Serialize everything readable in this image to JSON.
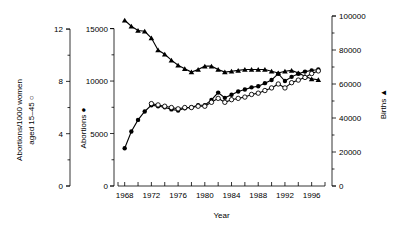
{
  "chart_data": {
    "type": "line",
    "title": "",
    "xlabel": "Year",
    "x": [
      1968,
      1969,
      1970,
      1971,
      1972,
      1973,
      1974,
      1975,
      1976,
      1977,
      1978,
      1979,
      1980,
      1981,
      1982,
      1983,
      1984,
      1985,
      1986,
      1987,
      1988,
      1989,
      1990,
      1991,
      1992,
      1993,
      1994,
      1995,
      1996,
      1997
    ],
    "xlim": [
      1967,
      1998
    ],
    "xticks_major": [
      1968,
      1972,
      1976,
      1980,
      1984,
      1988,
      1992,
      1996
    ],
    "xticks_minor": [
      1970,
      1974,
      1978,
      1982,
      1986,
      1990,
      1994
    ],
    "xtick_labels": [
      "1968",
      "1972",
      "1976",
      "1980",
      "1984",
      "1988",
      "1992",
      "1996"
    ],
    "grid": false,
    "legend_position": "axis-labels",
    "axes": [
      {
        "id": "rate-axis",
        "side": "left-outer",
        "label": "Abortions/1000 women aged 15–45 ○",
        "marker": "open-circle",
        "ticks": [
          0,
          4,
          8,
          12
        ],
        "tick_labels": [
          "0",
          "4",
          "8",
          "12"
        ],
        "minor_step": 2,
        "ylim": [
          0,
          13
        ]
      },
      {
        "id": "abortions-axis",
        "side": "left-inner",
        "label": "Abortions ●",
        "marker": "filled-circle",
        "ticks": [
          0,
          5000,
          10000,
          15000
        ],
        "tick_labels": [
          "0",
          "5000",
          "10000",
          "15000"
        ],
        "minor_step": 2500,
        "ylim": [
          0,
          16200
        ]
      },
      {
        "id": "births-axis",
        "side": "right",
        "label": "Births ▲",
        "marker": "filled-triangle",
        "ticks": [
          0,
          20000,
          40000,
          60000,
          80000,
          100000
        ],
        "tick_labels": [
          "0",
          "20000",
          "40000",
          "60000",
          "80000",
          "100000"
        ],
        "minor_step": 10000,
        "ylim": [
          0,
          100000
        ]
      }
    ],
    "series": [
      {
        "name": "Births",
        "axis": "births-axis",
        "marker": "filled-triangle",
        "values": [
          97500,
          94000,
          91500,
          91000,
          87000,
          80000,
          77500,
          74000,
          71000,
          69000,
          67000,
          68500,
          70500,
          70500,
          68500,
          67000,
          67500,
          68000,
          68500,
          68500,
          68500,
          68500,
          67500,
          66500,
          67500,
          68000,
          66500,
          64500,
          63000,
          62500
        ]
      },
      {
        "name": "Abortions",
        "axis": "abortions-axis",
        "marker": "filled-circle",
        "values": [
          3600,
          5200,
          6300,
          7100,
          7700,
          7600,
          7500,
          7300,
          7200,
          7400,
          7500,
          7700,
          7700,
          8200,
          8900,
          8400,
          8700,
          9000,
          9200,
          9400,
          9500,
          9800,
          10100,
          10700,
          10000,
          10400,
          10700,
          10900,
          11000,
          11100
        ]
      },
      {
        "name": "Abortions/1000 women aged 15-45",
        "axis": "rate-axis",
        "marker": "open-circle",
        "values": [
          null,
          null,
          null,
          null,
          6.3,
          6.2,
          6.1,
          6.0,
          5.9,
          6.0,
          6.0,
          6.1,
          6.1,
          6.4,
          6.7,
          6.4,
          6.6,
          6.7,
          6.8,
          7.0,
          7.1,
          7.3,
          7.5,
          7.8,
          7.5,
          7.9,
          8.1,
          8.3,
          8.6,
          8.8
        ]
      }
    ]
  }
}
